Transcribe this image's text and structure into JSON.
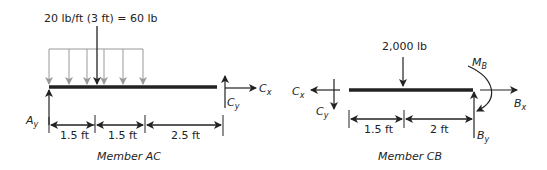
{
  "member_ac": {
    "caption": "Member AC",
    "distributed_load_label": "20 lb/ft (3 ft) = 60 lb",
    "reaction_a": {
      "symbol": "A",
      "sub": "y"
    },
    "reaction_cx": {
      "symbol": "C",
      "sub": "x"
    },
    "reaction_cy": {
      "symbol": "C",
      "sub": "y"
    },
    "dimensions": [
      "1.5 ft",
      "1.5 ft",
      "2.5 ft"
    ]
  },
  "member_cb": {
    "caption": "Member CB",
    "point_load_label": "2,000 lb",
    "reaction_cx": {
      "symbol": "C",
      "sub": "x"
    },
    "reaction_cy": {
      "symbol": "C",
      "sub": "y"
    },
    "moment_b": {
      "symbol": "M",
      "sub": "B"
    },
    "reaction_bx": {
      "symbol": "B",
      "sub": "x"
    },
    "reaction_by": {
      "symbol": "B",
      "sub": "y"
    },
    "dimensions": [
      "1.5 ft",
      "2 ft"
    ]
  },
  "colors": {
    "beam": "#222222",
    "distributed_load": "#999999",
    "arrows": "#222222"
  }
}
